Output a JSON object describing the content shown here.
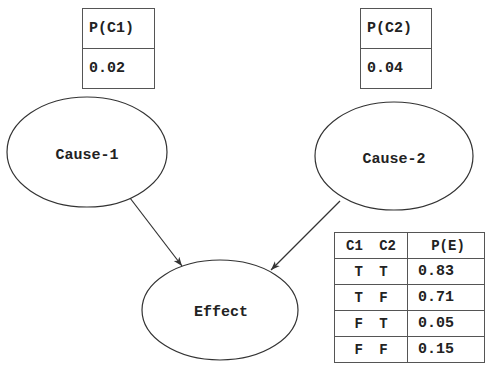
{
  "diagram": {
    "type": "bayesian-network",
    "nodes": [
      {
        "id": "cause1",
        "label": "Cause-1"
      },
      {
        "id": "cause2",
        "label": "Cause-2"
      },
      {
        "id": "effect",
        "label": "Effect"
      }
    ],
    "edges": [
      {
        "from": "cause1",
        "to": "effect"
      },
      {
        "from": "cause2",
        "to": "effect"
      }
    ],
    "priors": {
      "c1": {
        "header": "P(C1)",
        "value": "0.02"
      },
      "c2": {
        "header": "P(C2)",
        "value": "0.04"
      }
    },
    "cpt": {
      "headers": {
        "causes": "C1  C2",
        "prob": "P(E)"
      },
      "rows": [
        {
          "causes": "T  T",
          "prob": "0.83"
        },
        {
          "causes": "T  F",
          "prob": "0.71"
        },
        {
          "causes": "F  T",
          "prob": "0.05"
        },
        {
          "causes": "F  F",
          "prob": "0.15"
        }
      ]
    }
  }
}
